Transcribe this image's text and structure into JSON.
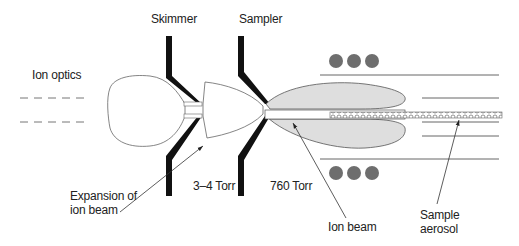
{
  "labels": {
    "skimmer": "Skimmer",
    "sampler": "Sampler",
    "ion_optics": "Ion optics",
    "expansion_line1": "Expansion of",
    "expansion_line2": "ion beam",
    "pressure_low": "3–4 Torr",
    "pressure_atm": "760 Torr",
    "ion_beam": "Ion beam",
    "sample_line1": "Sample",
    "sample_line2": "aerosol"
  },
  "colors": {
    "cone": "#111111",
    "outline": "#555555",
    "plasma_fill": "#dedede",
    "coil": "#6e6e6e",
    "line": "#666666"
  },
  "coil_turns_per_side": 3
}
